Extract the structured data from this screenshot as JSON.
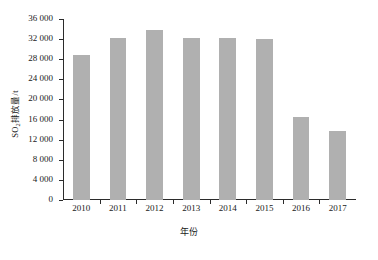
{
  "chart_data": {
    "type": "bar",
    "title": "",
    "subtitle": "",
    "xlabel": "年份",
    "ylabel": "SO₂排放量/t",
    "ylabel_main": "排放量/t",
    "ylabel_prefix": "SO",
    "ylabel_sub": "2",
    "categories": [
      "2010",
      "2011",
      "2012",
      "2013",
      "2014",
      "2015",
      "2016",
      "2017"
    ],
    "values": [
      28800,
      32300,
      33900,
      32200,
      32300,
      32000,
      16500,
      13800
    ],
    "ylim": [
      0,
      36000
    ],
    "ytick_values": [
      0,
      4000,
      8000,
      12000,
      16000,
      20000,
      24000,
      28000,
      32000,
      36000
    ],
    "ytick_labels": [
      "0",
      "4 000",
      "8 000",
      "12 000",
      "16 000",
      "20 000",
      "24 000",
      "28 000",
      "32 000",
      "36 000"
    ],
    "grid": false,
    "legend": null,
    "legend_position": "none",
    "bar_color": "#b0b0b0",
    "axis_color": "#2b2b2b",
    "background_color": "#ffffff"
  }
}
